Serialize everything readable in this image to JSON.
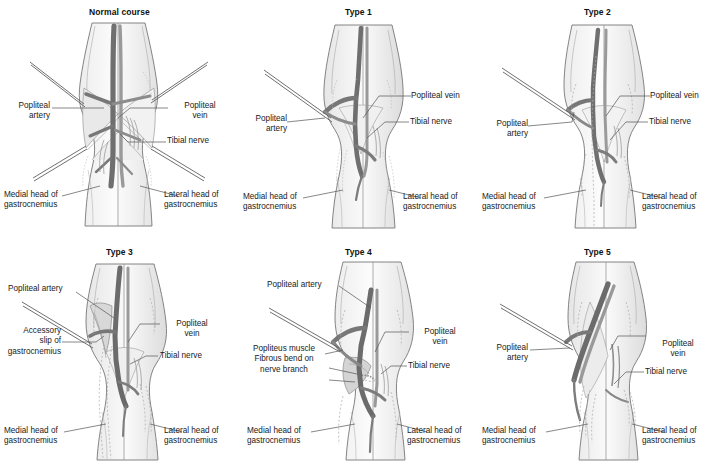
{
  "figure": {
    "type": "anatomical-illustration-grid",
    "columns": 3,
    "rows": 2,
    "background_color": "#ffffff",
    "palette": {
      "outline": "#6e6e6e",
      "skin_light": "#fbfbfb",
      "skin_shade": "#e3e3e3",
      "muscle_shade": "#d9d9d9",
      "vessel_dark": "#6b6b6b",
      "vessel_mid": "#8f8f8f",
      "vessel_light": "#bdbdbd",
      "text": "#1a1a1a",
      "leader_line": "#555555"
    }
  },
  "panels": [
    {
      "id": "normal-course",
      "title": "Normal course",
      "labels": [
        {
          "key": "popliteal-artery",
          "text": "Popliteal\nartery",
          "align": "right"
        },
        {
          "key": "popliteal-vein",
          "text": "Popliteal\nvein",
          "align": "left"
        },
        {
          "key": "tibial-nerve",
          "text": "Tibial nerve",
          "align": "left"
        },
        {
          "key": "medial-head-gastrocnemius",
          "text": "Medial head of\ngastrocnemius",
          "align": "left"
        },
        {
          "key": "lateral-head-gastrocnemius",
          "text": "Lateral head of\ngastrocnemius",
          "align": "left"
        }
      ]
    },
    {
      "id": "type-1",
      "title": "Type 1",
      "labels": [
        {
          "key": "popliteal-artery",
          "text": "Popliteal\nartery",
          "align": "right"
        },
        {
          "key": "popliteal-vein",
          "text": "Popliteal vein",
          "align": "left"
        },
        {
          "key": "tibial-nerve",
          "text": "Tibial nerve",
          "align": "left"
        },
        {
          "key": "medial-head-gastrocnemius",
          "text": "Medial head of\ngastrocnemius",
          "align": "left"
        },
        {
          "key": "lateral-head-gastrocnemius",
          "text": "Lateral head of\ngastrocnemius",
          "align": "left"
        }
      ]
    },
    {
      "id": "type-2",
      "title": "Type 2",
      "labels": [
        {
          "key": "popliteal-artery",
          "text": "Popliteal\nartery",
          "align": "right"
        },
        {
          "key": "popliteal-vein",
          "text": "Popliteal vein",
          "align": "left"
        },
        {
          "key": "tibial-nerve",
          "text": "Tibial nerve",
          "align": "left"
        },
        {
          "key": "medial-head-gastrocnemius",
          "text": "Medial head of\ngastrocnemius",
          "align": "left"
        },
        {
          "key": "lateral-head-gastrocnemius",
          "text": "Lateral head of\ngastrocnemius",
          "align": "left"
        }
      ]
    },
    {
      "id": "type-3",
      "title": "Type 3",
      "labels": [
        {
          "key": "popliteal-artery",
          "text": "Popliteal artery",
          "align": "left"
        },
        {
          "key": "accessory-slip-gastrocnemius",
          "text": "Accessory\nslip of\ngastrocnemius",
          "align": "right"
        },
        {
          "key": "popliteal-vein",
          "text": "Popliteal\nvein",
          "align": "left"
        },
        {
          "key": "tibial-nerve",
          "text": "Tibial nerve",
          "align": "left"
        },
        {
          "key": "medial-head-gastrocnemius",
          "text": "Medial head of\ngastrocnemius",
          "align": "left"
        },
        {
          "key": "lateral-head-gastrocnemius",
          "text": "Lateral head of\ngastrocnemius",
          "align": "left"
        }
      ]
    },
    {
      "id": "type-4",
      "title": "Type 4",
      "labels": [
        {
          "key": "popliteal-artery",
          "text": "Popliteal artery",
          "align": "left"
        },
        {
          "key": "popliteus-muscle-fibrous-bend",
          "text": "Popliteus muscle\nFibrous bend on\nnerve branch",
          "align": "center"
        },
        {
          "key": "popliteal-vein",
          "text": "Popliteal\nvein",
          "align": "left"
        },
        {
          "key": "tibial-nerve",
          "text": "Tibial nerve",
          "align": "left"
        },
        {
          "key": "medial-head-gastrocnemius",
          "text": "Medial head of\ngastrocnemius",
          "align": "left"
        },
        {
          "key": "lateral-head-gastrocnemius",
          "text": "Lateral head of\ngastrocnemius",
          "align": "left"
        }
      ]
    },
    {
      "id": "type-5",
      "title": "Type 5",
      "labels": [
        {
          "key": "popliteal-artery",
          "text": "Popliteal\nartery",
          "align": "right"
        },
        {
          "key": "popliteal-vein",
          "text": "Popliteal\nvein",
          "align": "left"
        },
        {
          "key": "tibial-nerve",
          "text": "Tibial nerve",
          "align": "left"
        },
        {
          "key": "medial-head-gastrocnemius",
          "text": "Medial head of\ngastrocnemius",
          "align": "left"
        },
        {
          "key": "lateral-head-gastrocnemius",
          "text": "Lateral head of\ngastrocnemius",
          "align": "left"
        }
      ]
    }
  ]
}
